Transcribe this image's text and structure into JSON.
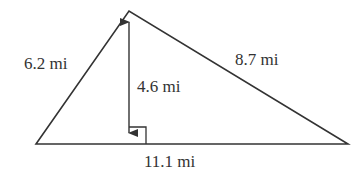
{
  "diagram": {
    "type": "triangle",
    "colors": {
      "stroke": "#333333",
      "text": "#333333",
      "background": "#ffffff"
    },
    "labels": {
      "left_side": "6.2 mi",
      "right_side": "8.7 mi",
      "height": "4.6 mi",
      "base": "11.1 mi"
    }
  }
}
